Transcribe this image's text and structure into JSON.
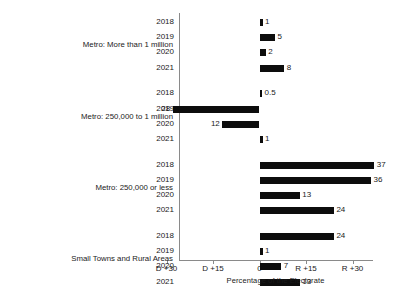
{
  "chart_data": {
    "type": "bar",
    "orientation": "horizontal",
    "title": "",
    "xlabel": "Percentage of the Electorate",
    "ylabel": "",
    "xlim": [
      -45,
      45
    ],
    "grid": false,
    "legend": null,
    "x_tick_labels": [
      "D +30",
      "D +15",
      "0",
      "R +15",
      "R +30"
    ],
    "x_tick_values": [
      -30,
      -15,
      0,
      15,
      30
    ],
    "note": "Negative values lean Democratic (D), positive values lean Republican (R). Bar labels show absolute margin.",
    "groups": [
      {
        "label": "Metro: More than 1 million",
        "categories": [
          "2018",
          "2019",
          "2020",
          "2021"
        ],
        "values": [
          1,
          5,
          2,
          8
        ],
        "value_labels": [
          "1",
          "5",
          "2",
          "8"
        ],
        "directions": [
          "R",
          "R",
          "R",
          "R"
        ]
      },
      {
        "label": "Metro: 250,000 to 1 million",
        "categories": [
          "2018",
          "2019",
          "2020",
          "2021"
        ],
        "values": [
          0.5,
          -28,
          -12,
          1
        ],
        "value_labels": [
          "0.5",
          "28",
          "12",
          "1"
        ],
        "directions": [
          "R",
          "D",
          "D",
          "R"
        ]
      },
      {
        "label": "Metro: 250,000 or less",
        "categories": [
          "2018",
          "2019",
          "2020",
          "2021"
        ],
        "values": [
          37,
          36,
          13,
          24
        ],
        "value_labels": [
          "37",
          "36",
          "13",
          "24"
        ],
        "directions": [
          "R",
          "R",
          "R",
          "R"
        ]
      },
      {
        "label": "Small Towns and Rural Areas",
        "categories": [
          "2018",
          "2019",
          "2020",
          "2021"
        ],
        "values": [
          24,
          1,
          7,
          13
        ],
        "value_labels": [
          "24",
          "1",
          "7",
          "13"
        ],
        "directions": [
          "R",
          "R",
          "R",
          "R"
        ]
      }
    ],
    "colors": {
      "bar": "#0d0d0d",
      "axis": "#8a8a8a",
      "text": "#1a1a1a",
      "background": "#ffffff"
    }
  }
}
